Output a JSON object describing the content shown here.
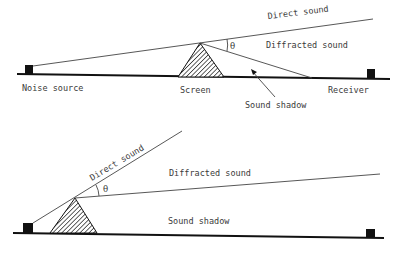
{
  "figure": {
    "top": {
      "labels": {
        "direct_sound": "Direct sound",
        "diffracted_sound": "Diffracted sound",
        "angle": "θ",
        "noise_source": "Noise source",
        "screen": "Screen",
        "receiver": "Receiver",
        "sound_shadow": "Sound shadow"
      }
    },
    "bottom": {
      "labels": {
        "direct_sound": "Direct sound",
        "diffracted_sound": "Diffracted sound",
        "angle": "θ",
        "sound_shadow": "Sound shadow"
      }
    },
    "colors": {
      "ink": "#111111",
      "text": "#3a3a3a",
      "background": "#ffffff"
    }
  }
}
